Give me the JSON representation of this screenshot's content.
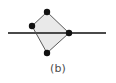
{
  "figure": {
    "caption": "(b)",
    "background_color": "#ffffff",
    "colors": {
      "polygon_fill": "#e9e9e9",
      "polygon_stroke": "#595959",
      "line_stroke": "#4a4a4a",
      "vertex_dot": "#111111",
      "caption_text": "#4d4d4d"
    },
    "geometry": {
      "polygon_name": "quadrilateral",
      "vertices": [
        {
          "name": "top-vertex",
          "x": 47,
          "y": 12
        },
        {
          "name": "right-vertex",
          "x": 69,
          "y": 33
        },
        {
          "name": "bottom-vertex",
          "x": 47,
          "y": 53
        },
        {
          "name": "left-vertex",
          "x": 32,
          "y": 26
        }
      ],
      "line": {
        "name": "horizontal-line",
        "x1": 8,
        "y1": 33,
        "x2": 106,
        "y2": 33
      },
      "vertex_dot_radius": 3,
      "polygon_stroke_width": 1,
      "line_stroke_width": 2
    }
  }
}
